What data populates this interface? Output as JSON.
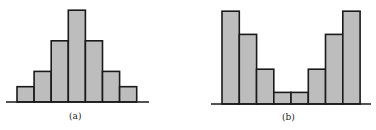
{
  "chart_data": [
    {
      "type": "bar",
      "subtype": "histogram",
      "caption": "(a)",
      "shape": "unimodal symmetric",
      "categories": [
        "1",
        "2",
        "3",
        "4",
        "5",
        "6",
        "7"
      ],
      "values": [
        1,
        2,
        4,
        6,
        4,
        2,
        1
      ],
      "title": "",
      "xlabel": "",
      "ylabel": "",
      "ylim": [
        0,
        6.5
      ],
      "grid": false,
      "axes": {
        "x_ticks": false,
        "y_axis": false
      },
      "fill_color": "#bdbdbd",
      "edge_color": "#1a1a1a"
    },
    {
      "type": "bar",
      "subtype": "histogram",
      "caption": "(b)",
      "shape": "bimodal U-shaped",
      "categories": [
        "1",
        "2",
        "3",
        "4",
        "5",
        "6",
        "7",
        "8"
      ],
      "values": [
        8,
        6,
        3,
        1,
        1,
        3,
        6,
        8
      ],
      "title": "",
      "xlabel": "",
      "ylabel": "",
      "ylim": [
        0,
        8.5
      ],
      "grid": false,
      "axes": {
        "x_ticks": false,
        "y_axis": false
      },
      "fill_color": "#bdbdbd",
      "edge_color": "#1a1a1a"
    }
  ],
  "captions": {
    "a": "(a)",
    "b": "(b)"
  }
}
